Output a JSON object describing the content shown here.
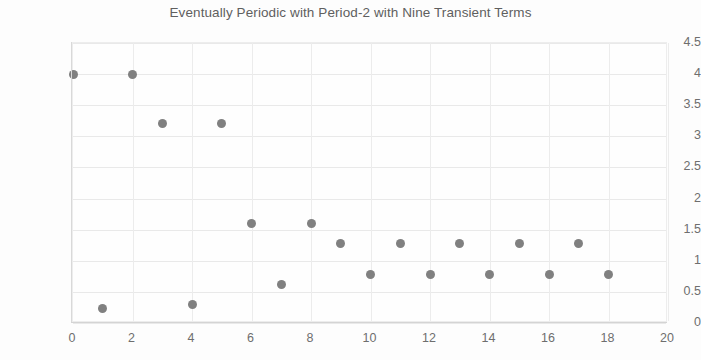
{
  "chart_data": {
    "type": "scatter",
    "title": "Eventually Periodic with Period-2 with Nine Transient Terms",
    "xlabel": "",
    "ylabel": "",
    "xlim": [
      0,
      20
    ],
    "ylim": [
      0,
      4.5
    ],
    "xticks": [
      0,
      2,
      4,
      6,
      8,
      10,
      12,
      14,
      16,
      18,
      20
    ],
    "yticks": [
      0,
      0.5,
      1,
      1.5,
      2,
      2.5,
      3,
      3.5,
      4,
      4.5
    ],
    "xtick_labels": [
      "0",
      "2",
      "4",
      "6",
      "8",
      "10",
      "12",
      "14",
      "16",
      "18",
      "20"
    ],
    "ytick_labels": [
      "0",
      "0.5",
      "1",
      "1.5",
      "2",
      "2.5",
      "3",
      "3.5",
      "4",
      "4.5"
    ],
    "grid": true,
    "legend": false,
    "marker_color": "#808080",
    "grid_color": "#e9e9e9",
    "title_color": "#5f5f5f",
    "tick_color": "#6e6e6e",
    "x": [
      0,
      1,
      2,
      3,
      4,
      5,
      6,
      7,
      8,
      9,
      10,
      11,
      12,
      13,
      14,
      15,
      16,
      17,
      18
    ],
    "y": [
      4,
      0.24,
      4,
      3.2,
      0.3,
      3.2,
      1.6,
      0.62,
      1.6,
      1.27,
      0.78,
      1.27,
      0.78,
      1.27,
      0.78,
      1.27,
      0.78,
      1.27,
      0.78
    ],
    "points": [
      {
        "x": 0,
        "y": 4
      },
      {
        "x": 1,
        "y": 0.24
      },
      {
        "x": 2,
        "y": 4
      },
      {
        "x": 3,
        "y": 3.2
      },
      {
        "x": 4,
        "y": 0.3
      },
      {
        "x": 5,
        "y": 3.2
      },
      {
        "x": 6,
        "y": 1.6
      },
      {
        "x": 7,
        "y": 0.62
      },
      {
        "x": 8,
        "y": 1.6
      },
      {
        "x": 9,
        "y": 1.27
      },
      {
        "x": 10,
        "y": 0.78
      },
      {
        "x": 11,
        "y": 1.27
      },
      {
        "x": 12,
        "y": 0.78
      },
      {
        "x": 13,
        "y": 1.27
      },
      {
        "x": 14,
        "y": 0.78
      },
      {
        "x": 15,
        "y": 1.27
      },
      {
        "x": 16,
        "y": 0.78
      },
      {
        "x": 17,
        "y": 1.27
      },
      {
        "x": 18,
        "y": 0.78
      }
    ]
  }
}
